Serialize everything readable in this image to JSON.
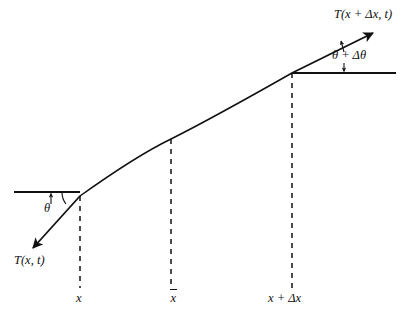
{
  "figure": {
    "background_color": "#ffffff",
    "stroke_color": "#111111",
    "width": 405,
    "height": 319
  },
  "labels": {
    "tension_right": "T(x + Δx, t)",
    "tension_left": "T(x, t)",
    "angle_right": "θ + Δθ",
    "angle_left": "θ",
    "axis_x": "x",
    "axis_xbar_base": "x",
    "axis_x_plus_dx": "x + Δx"
  },
  "geometry": {
    "curve_start": [
      80,
      196
    ],
    "curve_mid": [
      171,
      139
    ],
    "curve_end": [
      292,
      73
    ],
    "left_horizontal": [
      14,
      192,
      80,
      192
    ],
    "right_horizontal": [
      292,
      73,
      396,
      73
    ],
    "tension_left_arrow_tip": [
      31,
      250
    ],
    "tension_right_arrow_tip": [
      376,
      31
    ],
    "dashed_verticals_x": [
      80,
      171,
      292
    ],
    "dashed_bottom_y": 288
  }
}
